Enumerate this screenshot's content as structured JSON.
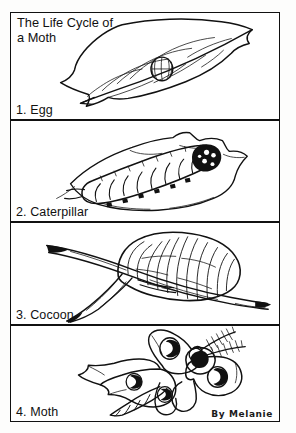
{
  "document": {
    "title_line_1": "The Life Cycle of",
    "title_line_2": "a Moth",
    "title": "The Life Cycle of\na Moth",
    "signature": "By Melanie",
    "background_color": "#fdfdfc",
    "ink_color": "#111111"
  },
  "panels": [
    {
      "number": "1",
      "label": "1. Egg",
      "stage": "egg",
      "art_name": "leaf-with-egg-drawing",
      "description": "A leaf with veins and a small round egg resting on it"
    },
    {
      "number": "2",
      "label": "2. Caterpillar",
      "stage": "caterpillar",
      "art_name": "caterpillar-on-leaf-drawing",
      "description": "A segmented caterpillar crawling on a leaf"
    },
    {
      "number": "3",
      "label": "3. Cocoon",
      "stage": "cocoon",
      "art_name": "cocoon-on-branch-drawing",
      "description": "A ribbed cocoon attached to a forked branch"
    },
    {
      "number": "4",
      "label": "4. Moth",
      "stage": "moth",
      "art_name": "moth-drawing",
      "description": "A moth with spotted wings, feathery antennae and a segmented body"
    }
  ]
}
